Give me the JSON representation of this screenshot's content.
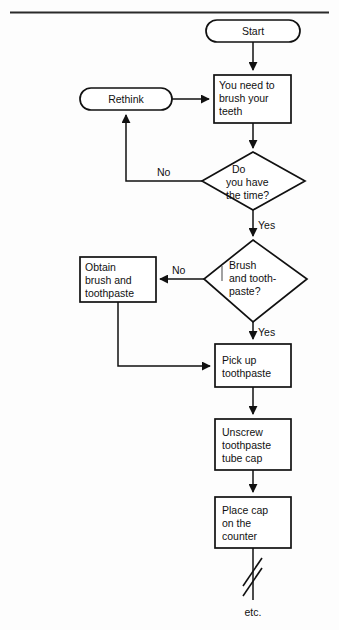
{
  "figure": {
    "top_rule": true,
    "background_color": "#fdfdfd",
    "line_color": "#111111"
  },
  "nodes": [
    {
      "id": "start",
      "shape": "terminator",
      "lines": [
        "Start"
      ],
      "name": "node-start"
    },
    {
      "id": "rethink",
      "shape": "terminator",
      "lines": [
        "Rethink"
      ],
      "name": "node-rethink"
    },
    {
      "id": "need-brush",
      "shape": "process",
      "lines": [
        "You need to",
        "brush your",
        "teeth"
      ],
      "name": "node-you-need-to-brush-your-teeth"
    },
    {
      "id": "have-time",
      "shape": "decision",
      "lines": [
        "Do",
        "you have",
        "the time?"
      ],
      "name": "node-do-you-have-the-time"
    },
    {
      "id": "have-supplies",
      "shape": "decision",
      "lines": [
        "Brush",
        "and tooth-",
        "paste?"
      ],
      "name": "node-brush-and-toothpaste"
    },
    {
      "id": "obtain",
      "shape": "process",
      "lines": [
        "Obtain",
        "brush and",
        "toothpaste"
      ],
      "name": "node-obtain-brush-and-toothpaste"
    },
    {
      "id": "pick-up",
      "shape": "process",
      "lines": [
        "Pick up",
        "toothpaste"
      ],
      "name": "node-pick-up-toothpaste"
    },
    {
      "id": "unscrew",
      "shape": "process",
      "lines": [
        "Unscrew",
        "toothpaste",
        "tube cap"
      ],
      "name": "node-unscrew-toothpaste-tube-cap"
    },
    {
      "id": "place-cap",
      "shape": "process",
      "lines": [
        "Place cap",
        "on the",
        "counter"
      ],
      "name": "node-place-cap-on-the-counter"
    }
  ],
  "edge_labels": {
    "time_no": "No",
    "time_yes": "Yes",
    "supplies_no": "No",
    "supplies_yes": "Yes"
  },
  "terminal": {
    "break_symbol": "flow-break",
    "etc_label": "etc."
  },
  "text": {
    "start": "Start",
    "rethink": "Rethink",
    "need_brush_l1": "You need to",
    "need_brush_l2": "brush your",
    "need_brush_l3": "teeth",
    "have_time_l1": "Do",
    "have_time_l2": "you have",
    "have_time_l3": "the time?",
    "supplies_l1": "Brush",
    "supplies_l2": "and tooth-",
    "supplies_l3": "paste?",
    "obtain_l1": "Obtain",
    "obtain_l2": "brush and",
    "obtain_l3": "toothpaste",
    "pickup_l1": "Pick up",
    "pickup_l2": "toothpaste",
    "unscrew_l1": "Unscrew",
    "unscrew_l2": "toothpaste",
    "unscrew_l3": "tube cap",
    "placecap_l1": "Place cap",
    "placecap_l2": "on the",
    "placecap_l3": "counter",
    "no_time": "No",
    "yes_time": "Yes",
    "no_supplies": "No",
    "yes_supplies": "Yes",
    "etc": "etc."
  }
}
